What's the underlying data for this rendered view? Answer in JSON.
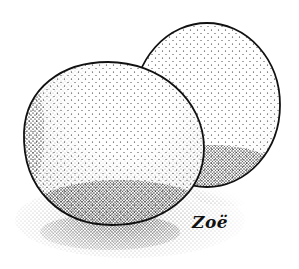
{
  "illustration": {
    "subject": "Two eggs, stippled pen-and-ink drawing",
    "signature": "Zoë",
    "colors": {
      "ink": "#111111",
      "paper": "#ffffff"
    }
  }
}
